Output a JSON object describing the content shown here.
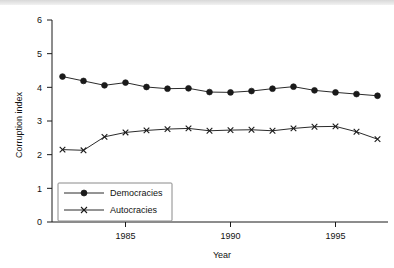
{
  "chart_data": {
    "type": "line",
    "title": "",
    "xlabel": "Year",
    "ylabel": "Corruption index",
    "xlim": [
      1981.5,
      1997.5
    ],
    "ylim": [
      0,
      6
    ],
    "grid": false,
    "legend_position": "bottom-left",
    "x": [
      1982,
      1983,
      1984,
      1985,
      1986,
      1987,
      1988,
      1989,
      1990,
      1991,
      1992,
      1993,
      1994,
      1995,
      1996,
      1997
    ],
    "xticks": [
      1985,
      1990,
      1995
    ],
    "xtick_labels": [
      "1985",
      "1990",
      "1995"
    ],
    "yticks": [
      0,
      1,
      2,
      3,
      4,
      5,
      6
    ],
    "ytick_labels": [
      "0",
      "1",
      "2",
      "3",
      "4",
      "5",
      "6"
    ],
    "series": [
      {
        "name": "Democracies",
        "marker": "circle",
        "values": [
          4.32,
          4.19,
          4.06,
          4.14,
          4.01,
          3.96,
          3.97,
          3.86,
          3.85,
          3.89,
          3.96,
          4.02,
          3.91,
          3.85,
          3.8,
          3.75
        ]
      },
      {
        "name": "Autocracies",
        "marker": "x",
        "values": [
          2.15,
          2.13,
          2.53,
          2.66,
          2.72,
          2.76,
          2.78,
          2.71,
          2.73,
          2.74,
          2.71,
          2.78,
          2.83,
          2.84,
          2.68,
          2.46
        ]
      }
    ]
  },
  "legend": {
    "entries": [
      {
        "label": "Democracies"
      },
      {
        "label": "Autocracies"
      }
    ]
  },
  "axes": {
    "y_title": "Corruption index",
    "x_title": "Year"
  }
}
